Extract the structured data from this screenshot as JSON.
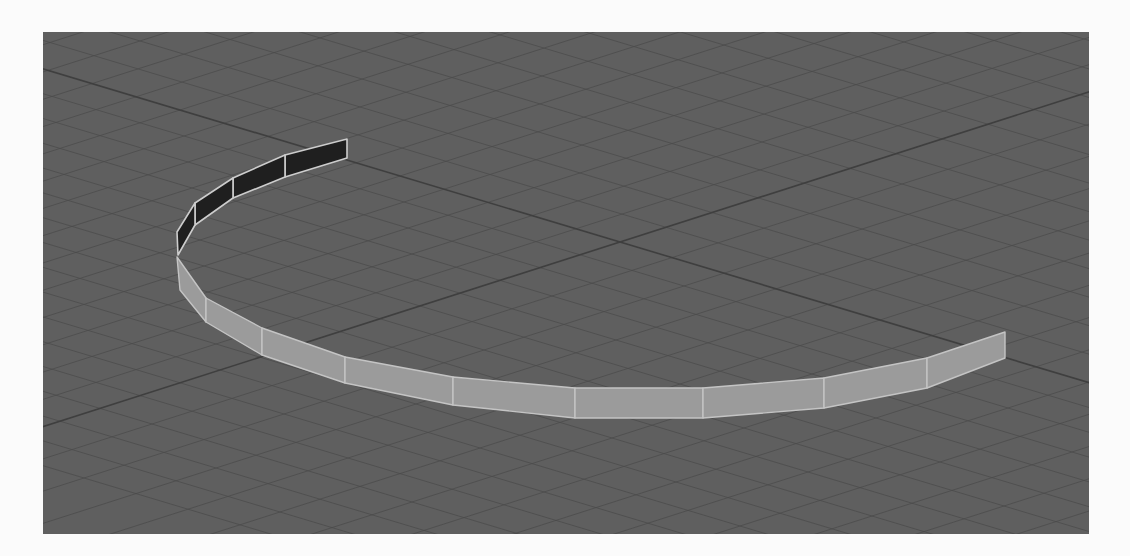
{
  "viewport": {
    "label": "3D perspective viewport",
    "background_color": "#5f5f5f",
    "grid_color": "#4b4b4b",
    "axis_color": "#3f3f3f",
    "origin": [
      577,
      210
    ]
  },
  "object": {
    "name": "curved-wall-strip",
    "type": "polygon strip (partial ring)",
    "back_face_color": "#1f1f1f",
    "front_face_color": "#9b9b9b",
    "edge_color": "#c8c8c8",
    "back_segments": [
      [
        [
          304,
          107
        ],
        [
          242,
          123
        ],
        [
          242,
          145
        ],
        [
          304,
          126
        ]
      ],
      [
        [
          242,
          123
        ],
        [
          190,
          146
        ],
        [
          190,
          166
        ],
        [
          242,
          145
        ]
      ],
      [
        [
          190,
          146
        ],
        [
          152,
          171
        ],
        [
          152,
          193
        ],
        [
          190,
          166
        ]
      ],
      [
        [
          152,
          171
        ],
        [
          134,
          200
        ],
        [
          135,
          223
        ],
        [
          152,
          193
        ]
      ]
    ],
    "front_segments": [
      [
        [
          134,
          225
        ],
        [
          163,
          266
        ],
        [
          163,
          290
        ],
        [
          137,
          258
        ]
      ],
      [
        [
          163,
          266
        ],
        [
          219,
          296
        ],
        [
          219,
          323
        ],
        [
          163,
          290
        ]
      ],
      [
        [
          219,
          296
        ],
        [
          302,
          325
        ],
        [
          302,
          351
        ],
        [
          219,
          323
        ]
      ],
      [
        [
          302,
          325
        ],
        [
          410,
          345
        ],
        [
          410,
          373
        ],
        [
          302,
          351
        ]
      ],
      [
        [
          410,
          345
        ],
        [
          532,
          356
        ],
        [
          532,
          386
        ],
        [
          410,
          373
        ]
      ],
      [
        [
          532,
          356
        ],
        [
          660,
          356
        ],
        [
          660,
          386
        ],
        [
          532,
          386
        ]
      ],
      [
        [
          660,
          356
        ],
        [
          781,
          346
        ],
        [
          781,
          376
        ],
        [
          660,
          386
        ]
      ],
      [
        [
          781,
          346
        ],
        [
          884,
          326
        ],
        [
          884,
          356
        ],
        [
          781,
          376
        ]
      ],
      [
        [
          884,
          326
        ],
        [
          962,
          300
        ],
        [
          962,
          326
        ],
        [
          884,
          356
        ]
      ]
    ]
  }
}
